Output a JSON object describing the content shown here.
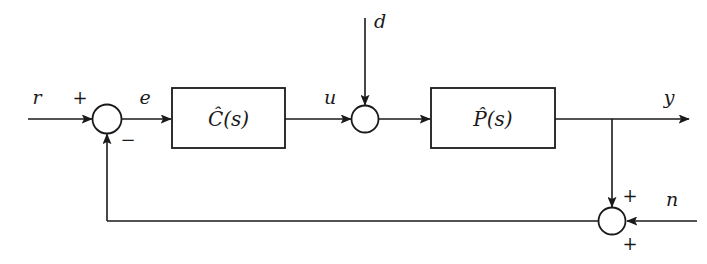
{
  "diagram": {
    "type": "control-system-block-diagram",
    "stroke_color": "#1a1a1a",
    "background_color": "#ffffff",
    "signals": {
      "reference": "r",
      "error": "e",
      "control": "u",
      "disturbance": "d",
      "output": "y",
      "noise": "n"
    },
    "blocks": {
      "controller": "Ĉ(s)",
      "plant": "P̂(s)"
    },
    "signs": {
      "reference_sign": "+",
      "feedback_sign": "−",
      "output_sum_sign": "+",
      "noise_sum_sign": "+"
    }
  }
}
